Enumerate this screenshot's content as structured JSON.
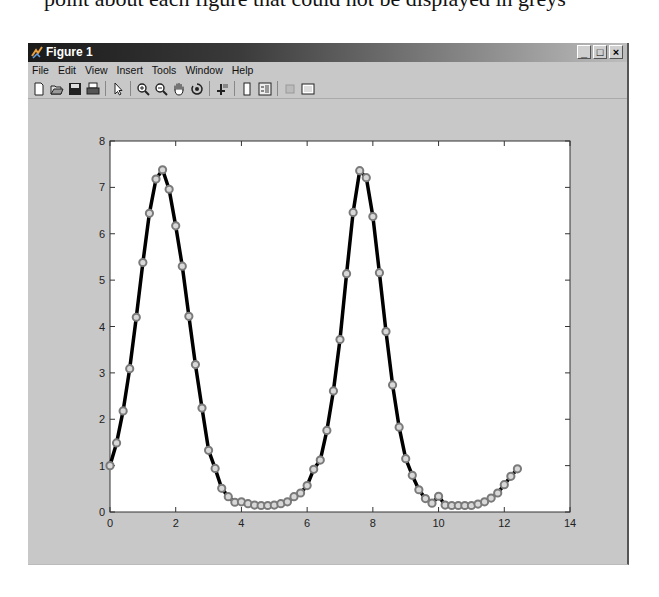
{
  "caption": "point about each figure that could not be displayed in greys",
  "window": {
    "title": "Figure 1",
    "controls": {
      "minimize": "_",
      "maximize": "□",
      "close": "×"
    }
  },
  "menu": [
    {
      "label": "File"
    },
    {
      "label": "Edit"
    },
    {
      "label": "View"
    },
    {
      "label": "Insert"
    },
    {
      "label": "Tools"
    },
    {
      "label": "Window"
    },
    {
      "label": "Help"
    }
  ],
  "toolbar": [
    {
      "icon": "new-figure-icon"
    },
    {
      "icon": "open-file-icon"
    },
    {
      "icon": "save-icon"
    },
    {
      "icon": "print-icon"
    },
    {
      "icon": "separator"
    },
    {
      "icon": "edit-plot-arrow-icon"
    },
    {
      "icon": "separator"
    },
    {
      "icon": "zoom-in-icon"
    },
    {
      "icon": "zoom-out-icon"
    },
    {
      "icon": "pan-hand-icon"
    },
    {
      "icon": "rotate-3d-icon"
    },
    {
      "icon": "separator"
    },
    {
      "icon": "data-cursor-icon"
    },
    {
      "icon": "separator"
    },
    {
      "icon": "colorbar-icon"
    },
    {
      "icon": "legend-icon"
    },
    {
      "icon": "separator"
    },
    {
      "icon": "hide-plot-tools-icon"
    },
    {
      "icon": "show-plot-tools-icon"
    }
  ],
  "colors": {
    "figure_bg": "#c8c8c8",
    "axes_bg": "#ffffff",
    "line": "#000000",
    "marker": "#7a7a7a"
  },
  "chart_data": {
    "type": "line",
    "title": "",
    "xlabel": "",
    "ylabel": "",
    "xlim": [
      0,
      14
    ],
    "ylim": [
      0,
      8
    ],
    "xticks": [
      0,
      2,
      4,
      6,
      8,
      10,
      12,
      14
    ],
    "yticks": [
      0,
      1,
      2,
      3,
      4,
      5,
      6,
      7,
      8
    ],
    "grid": false,
    "legend": null,
    "series": [
      {
        "name": "exp(2*sin(t))",
        "style": "black line, grey circle markers",
        "x": [
          0,
          0.2,
          0.4,
          0.6,
          0.8,
          1.0,
          1.2,
          1.4,
          1.6,
          1.8,
          2.0,
          2.2,
          2.4,
          2.6,
          2.8,
          3.0,
          3.2,
          3.4,
          3.6,
          3.8,
          4.0,
          4.2,
          4.4,
          4.6,
          4.8,
          5.0,
          5.2,
          5.4,
          5.6,
          5.8,
          6.0,
          6.2,
          6.4,
          6.6,
          6.8,
          7.0,
          7.2,
          7.4,
          7.6,
          7.8,
          8.0,
          8.2,
          8.4,
          8.6,
          8.8,
          9.0,
          9.2,
          9.4,
          9.6,
          9.8,
          10.0,
          10.2,
          10.4,
          10.6,
          10.8,
          11.0,
          11.2,
          11.4,
          11.6,
          11.8,
          12.0,
          12.2,
          12.4
        ],
        "y": [
          1.0,
          1.49,
          2.18,
          3.09,
          4.2,
          5.38,
          6.44,
          7.18,
          7.38,
          6.96,
          6.17,
          5.3,
          4.22,
          3.18,
          2.24,
          1.33,
          0.94,
          0.51,
          0.33,
          0.21,
          0.22,
          0.18,
          0.15,
          0.14,
          0.14,
          0.15,
          0.18,
          0.22,
          0.33,
          0.41,
          0.57,
          0.92,
          1.12,
          1.76,
          2.61,
          3.72,
          5.14,
          6.46,
          7.36,
          7.21,
          6.37,
          5.16,
          3.89,
          2.74,
          1.83,
          1.15,
          0.79,
          0.48,
          0.29,
          0.19,
          0.34,
          0.15,
          0.14,
          0.14,
          0.14,
          0.14,
          0.17,
          0.22,
          0.3,
          0.41,
          0.59,
          0.77,
          0.93
        ]
      }
    ]
  }
}
